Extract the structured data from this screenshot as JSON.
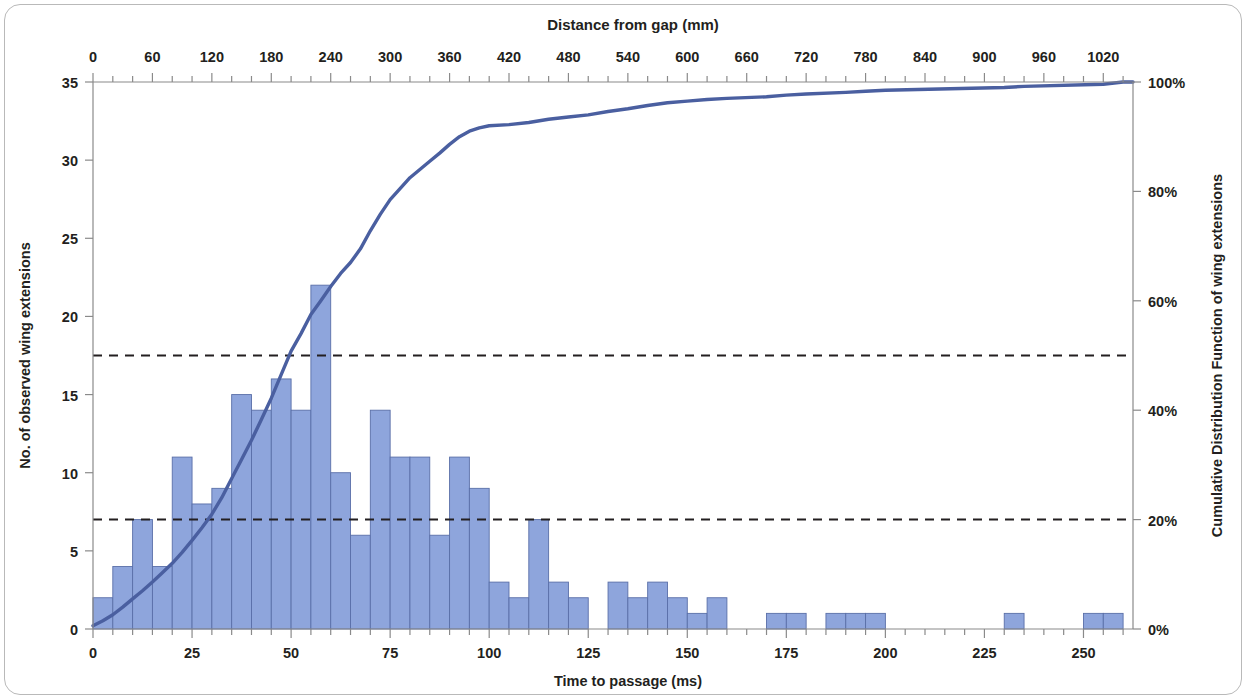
{
  "chart_data": {
    "type": "bar",
    "title": "Distance  from gap (mm)",
    "subtitle": "",
    "xlabel": "Time to passage (ms)",
    "ylabel": "No. of observed wing extensions",
    "y2label": "Cumulative Distribution Function of wing extensions",
    "top_axis_label": "Distance  from gap (mm)",
    "xlim": [
      0,
      262.5
    ],
    "ylim": [
      0,
      35
    ],
    "y2lim": [
      0,
      100
    ],
    "top_xlim": [
      0,
      1050
    ],
    "grid": false,
    "legend": null,
    "bin_width": 5,
    "xticks": [
      "0",
      "25",
      "50",
      "75",
      "100",
      "125",
      "150",
      "175",
      "200",
      "225",
      "250"
    ],
    "xtick_values": [
      0,
      25,
      50,
      75,
      100,
      125,
      150,
      175,
      200,
      225,
      250
    ],
    "yticks": [
      "0",
      "5",
      "10",
      "15",
      "20",
      "25",
      "30",
      "35"
    ],
    "ytick_values": [
      0,
      5,
      10,
      15,
      20,
      25,
      30,
      35
    ],
    "y2ticks": [
      "0%",
      "20%",
      "40%",
      "60%",
      "80%",
      "100%"
    ],
    "y2tick_values": [
      0,
      20,
      40,
      60,
      80,
      100
    ],
    "top_xticks": [
      "0",
      "60",
      "120",
      "180",
      "240",
      "300",
      "360",
      "420",
      "480",
      "540",
      "600",
      "660",
      "720",
      "780",
      "840",
      "900",
      "960",
      "1020"
    ],
    "top_xtick_values": [
      0,
      60,
      120,
      180,
      240,
      300,
      360,
      420,
      480,
      540,
      600,
      660,
      720,
      780,
      840,
      900,
      960,
      1020
    ],
    "bar_color": "#8EA5DC",
    "bar_edge_color": "#5A6FA8",
    "line_color": "#4A5FA0",
    "reference_line_color": "#231f20",
    "bin_starts": [
      0,
      5,
      10,
      15,
      20,
      25,
      30,
      35,
      40,
      45,
      50,
      55,
      60,
      65,
      70,
      75,
      80,
      85,
      90,
      95,
      100,
      105,
      110,
      115,
      120,
      125,
      130,
      135,
      140,
      145,
      150,
      155,
      160,
      165,
      170,
      175,
      180,
      185,
      190,
      195,
      200,
      205,
      210,
      215,
      220,
      225,
      230,
      235,
      240,
      245,
      250,
      255,
      260
    ],
    "values": [
      2,
      4,
      7,
      4,
      11,
      8,
      9,
      15,
      14,
      16,
      14,
      22,
      10,
      6,
      14,
      11,
      11,
      6,
      11,
      9,
      3,
      2,
      7,
      3,
      2,
      0,
      3,
      2,
      3,
      2,
      1,
      2,
      0,
      0,
      1,
      1,
      0,
      1,
      1,
      1,
      0,
      0,
      0,
      0,
      0,
      0,
      1,
      0,
      0,
      0,
      1,
      1,
      0
    ],
    "cdf_x": [
      0,
      2.5,
      5,
      7.5,
      10,
      12.5,
      15,
      17.5,
      20,
      22.5,
      25,
      27.5,
      30,
      32.5,
      35,
      37.5,
      40,
      42.5,
      45,
      47.5,
      50,
      52.5,
      55,
      57.5,
      60,
      62.5,
      65,
      67.5,
      70,
      72.5,
      75,
      77.5,
      80,
      82.5,
      85,
      87.5,
      90,
      92.5,
      95,
      97.5,
      100,
      105,
      110,
      115,
      120,
      125,
      130,
      135,
      140,
      145,
      150,
      155,
      160,
      170,
      175,
      180,
      190,
      195,
      200,
      230,
      235,
      255,
      260,
      262.5
    ],
    "cdf_y": [
      0.6,
      1.5,
      2.6,
      4.0,
      5.5,
      7.0,
      8.6,
      10.3,
      12.0,
      14.0,
      16.2,
      18.5,
      21.0,
      24.0,
      27.5,
      31.0,
      34.5,
      38.3,
      42.2,
      46.5,
      50.8,
      54.0,
      57.5,
      60.0,
      62.6,
      65.0,
      67.0,
      69.5,
      72.8,
      75.8,
      78.5,
      80.5,
      82.5,
      84.0,
      85.5,
      87.0,
      88.6,
      90.0,
      91.0,
      91.6,
      92.0,
      92.2,
      92.6,
      93.2,
      93.6,
      94.0,
      94.6,
      95.1,
      95.7,
      96.2,
      96.5,
      96.8,
      97.0,
      97.3,
      97.6,
      97.8,
      98.1,
      98.3,
      98.5,
      99.0,
      99.2,
      99.6,
      100.0,
      100.0
    ],
    "reference_lines": [
      {
        "label": "50%",
        "y2_value": 50,
        "y_value": 17.5,
        "style": "dashed"
      },
      {
        "label": "20%",
        "y2_value": 20,
        "y_value": 7,
        "style": "dashed"
      }
    ]
  }
}
